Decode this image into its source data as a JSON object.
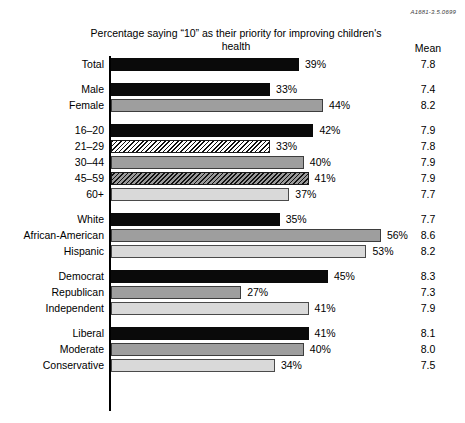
{
  "refcode": "A1681-3.5.0699",
  "title": "Percentage saying “10” as their priority for improving children's health",
  "mean_header": "Mean",
  "chart_data": {
    "type": "bar",
    "orientation": "horizontal",
    "title": "Percentage saying “10” as their priority for improving children's health",
    "xlabel": "",
    "ylabel": "",
    "xlim": [
      0,
      60
    ],
    "grid": false,
    "legend": "none",
    "value_suffix": "%",
    "extra_column": {
      "header": "Mean",
      "values": [
        7.8,
        7.4,
        8.2,
        7.9,
        7.8,
        7.9,
        7.9,
        7.7,
        7.7,
        8.6,
        8.2,
        8.3,
        7.3,
        7.9,
        8.1,
        8.0,
        7.5
      ]
    },
    "categories": [
      "Total",
      "Male",
      "Female",
      "16–20",
      "21–29",
      "30–44",
      "45–59",
      "60+",
      "White",
      "African-American",
      "Hispanic",
      "Democrat",
      "Republican",
      "Independent",
      "Liberal",
      "Moderate",
      "Conservative"
    ],
    "values": [
      39,
      33,
      44,
      42,
      33,
      40,
      41,
      37,
      35,
      56,
      53,
      45,
      27,
      41,
      41,
      40,
      34
    ],
    "groups": [
      {
        "name": "total",
        "rows": [
          {
            "label": "Total",
            "value": 39,
            "value_label": "39%",
            "mean": "7.8",
            "fill": "f-black"
          }
        ]
      },
      {
        "name": "gender",
        "rows": [
          {
            "label": "Male",
            "value": 33,
            "value_label": "33%",
            "mean": "7.4",
            "fill": "f-black"
          },
          {
            "label": "Female",
            "value": 44,
            "value_label": "44%",
            "mean": "8.2",
            "fill": "f-gray"
          }
        ]
      },
      {
        "name": "age",
        "rows": [
          {
            "label": "16–20",
            "value": 42,
            "value_label": "42%",
            "mean": "7.9",
            "fill": "f-black"
          },
          {
            "label": "21–29",
            "value": 33,
            "value_label": "33%",
            "mean": "7.8",
            "fill": "f-hatch-light"
          },
          {
            "label": "30–44",
            "value": 40,
            "value_label": "40%",
            "mean": "7.9",
            "fill": "f-gray"
          },
          {
            "label": "45–59",
            "value": 41,
            "value_label": "41%",
            "mean": "7.9",
            "fill": "f-hatch-dark"
          },
          {
            "label": "60+",
            "value": 37,
            "value_label": "37%",
            "mean": "7.7",
            "fill": "f-light"
          }
        ]
      },
      {
        "name": "race",
        "rows": [
          {
            "label": "White",
            "value": 35,
            "value_label": "35%",
            "mean": "7.7",
            "fill": "f-black"
          },
          {
            "label": "African-American",
            "value": 56,
            "value_label": "56%",
            "mean": "8.6",
            "fill": "f-gray"
          },
          {
            "label": "Hispanic",
            "value": 53,
            "value_label": "53%",
            "mean": "8.2",
            "fill": "f-light"
          }
        ]
      },
      {
        "name": "party",
        "rows": [
          {
            "label": "Democrat",
            "value": 45,
            "value_label": "45%",
            "mean": "8.3",
            "fill": "f-black"
          },
          {
            "label": "Republican",
            "value": 27,
            "value_label": "27%",
            "mean": "7.3",
            "fill": "f-gray"
          },
          {
            "label": "Independent",
            "value": 41,
            "value_label": "41%",
            "mean": "7.9",
            "fill": "f-light"
          }
        ]
      },
      {
        "name": "ideology",
        "rows": [
          {
            "label": "Liberal",
            "value": 41,
            "value_label": "41%",
            "mean": "8.1",
            "fill": "f-black"
          },
          {
            "label": "Moderate",
            "value": 40,
            "value_label": "40%",
            "mean": "8.0",
            "fill": "f-gray"
          },
          {
            "label": "Conservative",
            "value": 34,
            "value_label": "34%",
            "mean": "7.5",
            "fill": "f-light"
          }
        ]
      }
    ]
  }
}
